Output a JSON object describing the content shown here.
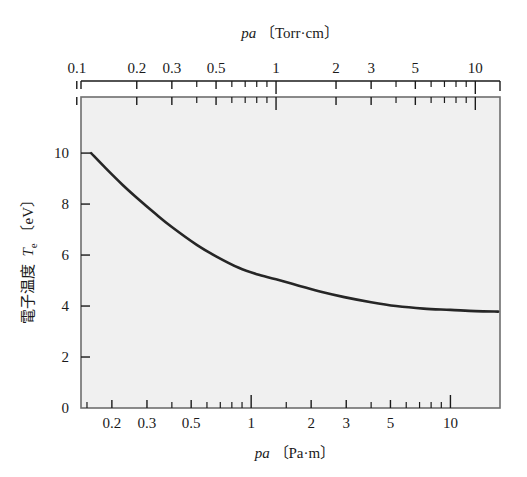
{
  "figure": {
    "top_axis_title": "pa 〔Torr·cm〕",
    "top_axis_title_var": "pa",
    "top_axis_title_unit": "〔Torr·cm〕",
    "bottom_axis_title": "pa 〔Pa·m〕",
    "bottom_axis_title_var": "pa",
    "bottom_axis_title_unit": "〔Pa·m〕",
    "y_axis_title_jp": "電子温度",
    "y_axis_title_var": "T",
    "y_axis_title_sub": "e",
    "y_axis_title_unit": "〔eV〕",
    "curve_color": "#262626",
    "plot_background": "#f0f0f0",
    "frame_color": "#6e6e6e",
    "text_color": "#1a1a1a"
  },
  "chart_data": {
    "type": "line",
    "title": "",
    "subtitle": "",
    "xlabel": "pa 〔Pa·m〕",
    "xlabel_top": "pa 〔Torr·cm〕",
    "ylabel": "電子温度 Te 〔eV〕",
    "xscale": "log",
    "yscale": "linear",
    "grid": false,
    "legend": "none",
    "ylim": [
      0,
      12.2
    ],
    "y_ticks": [
      0,
      2,
      4,
      6,
      8,
      10
    ],
    "y_tick_labels": [
      "0",
      "2",
      "4",
      "6",
      "8",
      "10"
    ],
    "xlim_torr_cm": [
      0.105,
      13.3
    ],
    "x_ticks_top_torr_cm": [
      0.1,
      0.2,
      0.3,
      0.5,
      1,
      2,
      3,
      5,
      10
    ],
    "x_tick_labels_top": [
      "0.1",
      "0.2",
      "0.3",
      "0.5",
      "1",
      "2",
      "3",
      "5",
      "10"
    ],
    "x_minor_ticks_top_torr_cm": [
      0.4,
      0.6,
      0.7,
      0.8,
      0.9,
      4,
      6,
      7,
      8,
      9
    ],
    "x_ticks_bottom_pa_m": [
      0.2,
      0.3,
      0.5,
      1,
      2,
      3,
      5,
      10
    ],
    "x_tick_labels_bottom": [
      "0.2",
      "0.3",
      "0.5",
      "1",
      "2",
      "3",
      "5",
      "10"
    ],
    "x_minor_ticks_bottom_pa_m": [
      0.15,
      0.4,
      0.6,
      0.7,
      0.8,
      0.9,
      1.5,
      4,
      6,
      7,
      8,
      9
    ],
    "unit_conversion_pa_m_per_torr_cm": 1.3332,
    "series": [
      {
        "name": "Te",
        "x_unit": "Torr·cm",
        "y_unit": "eV",
        "points": [
          [
            0.118,
            10.0
          ],
          [
            0.14,
            9.4
          ],
          [
            0.17,
            8.75
          ],
          [
            0.2,
            8.25
          ],
          [
            0.25,
            7.6
          ],
          [
            0.3,
            7.1
          ],
          [
            0.4,
            6.4
          ],
          [
            0.5,
            5.95
          ],
          [
            0.65,
            5.5
          ],
          [
            0.8,
            5.25
          ],
          [
            1.0,
            5.05
          ],
          [
            1.3,
            4.8
          ],
          [
            1.7,
            4.55
          ],
          [
            2.2,
            4.35
          ],
          [
            3.0,
            4.15
          ],
          [
            4.0,
            4.0
          ],
          [
            5.5,
            3.9
          ],
          [
            7.5,
            3.85
          ],
          [
            10.0,
            3.8
          ],
          [
            13.0,
            3.78
          ]
        ]
      }
    ]
  }
}
